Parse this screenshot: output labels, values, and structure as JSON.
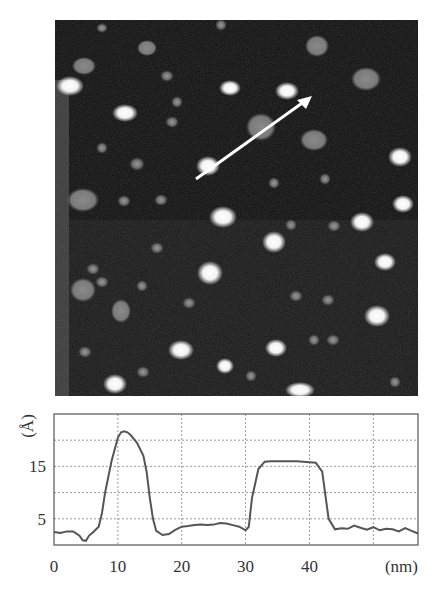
{
  "figure": {
    "image_panel": {
      "description": "AFM topography image with particles and an arrow marking the line profile",
      "arrow": {
        "x1": 141,
        "y1": 159,
        "x2": 257,
        "y2": 76,
        "color": "#ffffff"
      }
    }
  },
  "chart_data": {
    "type": "line",
    "title": "",
    "xlabel": "(nm)",
    "ylabel": "(Å)",
    "xlim": [
      0,
      57
    ],
    "ylim": [
      0,
      25
    ],
    "grid": true,
    "x_ticks": [
      "0",
      "10",
      "20",
      "30",
      "40"
    ],
    "y_ticks": [
      "5",
      "15"
    ],
    "y_gridlines": [
      5,
      10,
      15,
      20
    ],
    "x_gridlines": [
      10,
      20,
      30,
      40,
      50
    ],
    "series": [
      {
        "name": "height profile",
        "x": [
          0,
          1,
          2,
          3,
          4,
          4.5,
          5,
          5.5,
          6,
          7,
          7.5,
          8,
          9,
          10,
          10.5,
          11,
          11.5,
          12,
          13,
          14,
          14.5,
          15,
          15.5,
          16,
          17,
          18,
          19,
          20,
          21,
          22,
          23,
          24,
          25,
          26,
          27,
          28,
          29,
          30,
          30.5,
          31,
          32,
          33,
          34,
          35,
          36,
          37,
          38,
          39,
          40,
          41,
          42,
          43,
          44,
          45,
          46,
          47,
          48,
          49,
          50,
          51,
          52,
          53,
          54,
          55,
          56,
          57
        ],
        "y": [
          2.5,
          2.3,
          2.6,
          2.6,
          1.8,
          0.9,
          0.8,
          1.8,
          2.3,
          3.5,
          6,
          10,
          16,
          20.5,
          21.5,
          21.7,
          21.5,
          21,
          19.5,
          17,
          14,
          9,
          5,
          2.7,
          1.9,
          2.1,
          2.9,
          3.5,
          3.6,
          3.8,
          3.9,
          3.8,
          3.9,
          4.2,
          4.1,
          3.8,
          3.5,
          2.8,
          3.5,
          9,
          14.5,
          15.9,
          16,
          16,
          16,
          16,
          16,
          15.9,
          15.8,
          15.7,
          14,
          5,
          3,
          3.2,
          3.1,
          3.7,
          3.3,
          2.9,
          3.4,
          2.8,
          3.1,
          3.0,
          2.6,
          3.2,
          2.7,
          2.2
        ]
      }
    ],
    "annotations": {
      "peak_1": {
        "x": 11,
        "y": 21.7
      },
      "plateau_2": {
        "x_range": [
          32.5,
          41
        ],
        "y": 16
      }
    }
  }
}
